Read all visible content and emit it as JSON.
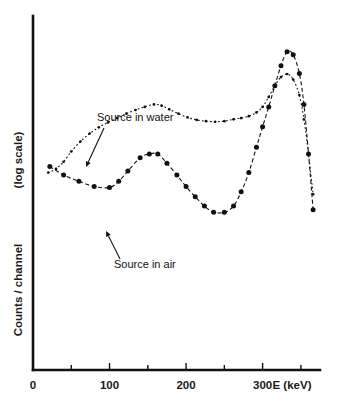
{
  "figure": {
    "background": "#ffffff",
    "ink": "#111111"
  },
  "axes": {
    "x": {
      "label": "E  (keV)",
      "major_ticks": [
        0,
        100,
        200,
        300
      ],
      "major_tick_labels": [
        "0",
        "100",
        "200",
        "300"
      ],
      "minor_ticks": [
        50,
        150,
        250,
        350
      ],
      "range": [
        0,
        375
      ]
    },
    "y": {
      "label_main": "Counts / channel",
      "label_scale": "(log scale)",
      "scale": "log",
      "ticks": [],
      "tick_labels": []
    }
  },
  "annotations": [
    {
      "name": "source-in-water",
      "text": "Source in water",
      "text_x": 97,
      "text_y": 121,
      "arrow_from": [
        104,
        128
      ],
      "arrow_to": [
        86,
        167
      ]
    },
    {
      "name": "source-in-air",
      "text": "Source in air",
      "text_x": 114,
      "text_y": 268,
      "arrow_from": [
        120,
        259
      ],
      "arrow_to": [
        106,
        231
      ]
    }
  ],
  "chart_data": {
    "type": "line",
    "title": "",
    "xlabel": "E  (keV)",
    "ylabel": "Counts / channel (log scale)",
    "xlim": [
      0,
      375
    ],
    "ylog": true,
    "grid": false,
    "legend": "inline-annotations",
    "series": [
      {
        "name": "Source in air",
        "marker": "filled-circle",
        "line": "dash-dot",
        "x": [
          22,
          40,
          60,
          80,
          100,
          112,
          124,
          140,
          152,
          163,
          175,
          188,
          200,
          212,
          224,
          236,
          250,
          262,
          272,
          282,
          292,
          300,
          308,
          316,
          324,
          332,
          340,
          348,
          354,
          360,
          366
        ],
        "y_rel": [
          0.56,
          0.532,
          0.512,
          0.495,
          0.492,
          0.512,
          0.545,
          0.588,
          0.6,
          0.6,
          0.57,
          0.532,
          0.495,
          0.462,
          0.432,
          0.412,
          0.412,
          0.432,
          0.478,
          0.54,
          0.622,
          0.688,
          0.752,
          0.82,
          0.885,
          0.93,
          0.92,
          0.86,
          0.76,
          0.6,
          0.42
        ]
      },
      {
        "name": "Source in water",
        "marker": "small-dot",
        "line": "dotted",
        "x": [
          20,
          30,
          40,
          50,
          62,
          74,
          86,
          98,
          110,
          122,
          134,
          146,
          158,
          168,
          178,
          190,
          202,
          214,
          226,
          238,
          250,
          262,
          272,
          282,
          292,
          300,
          308,
          316,
          324,
          332,
          340,
          348,
          354,
          360,
          366
        ],
        "y_rel": [
          0.54,
          0.552,
          0.575,
          0.608,
          0.64,
          0.666,
          0.686,
          0.702,
          0.716,
          0.73,
          0.742,
          0.752,
          0.76,
          0.756,
          0.744,
          0.73,
          0.718,
          0.71,
          0.706,
          0.704,
          0.706,
          0.712,
          0.716,
          0.722,
          0.734,
          0.752,
          0.784,
          0.82,
          0.848,
          0.858,
          0.84,
          0.79,
          0.712,
          0.6,
          0.47
        ]
      }
    ]
  }
}
